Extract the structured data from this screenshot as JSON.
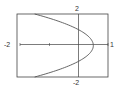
{
  "chart_data": {
    "type": "line",
    "title": "",
    "xlabel": "",
    "ylabel": "",
    "xlim": [
      -2,
      1
    ],
    "ylim": [
      -2,
      2
    ],
    "grid": false,
    "legend": null,
    "tick_labels": {
      "x_min": "-2",
      "x_max": "1",
      "y_max": "2",
      "y_min": "-2"
    },
    "x_ticks": [
      -1
    ],
    "series": [
      {
        "name": "x = 0.5(1 - y^2)",
        "points": [
          {
            "x": -1.5,
            "y": 2.0
          },
          {
            "x": -1.0,
            "y": 1.73
          },
          {
            "x": -0.5,
            "y": 1.41
          },
          {
            "x": 0.0,
            "y": 1.0
          },
          {
            "x": 0.3,
            "y": 0.63
          },
          {
            "x": 0.5,
            "y": 0.0
          },
          {
            "x": 0.3,
            "y": -0.63
          },
          {
            "x": 0.0,
            "y": -1.0
          },
          {
            "x": -0.5,
            "y": -1.41
          },
          {
            "x": -1.0,
            "y": -1.73
          },
          {
            "x": -1.5,
            "y": -2.0
          }
        ]
      }
    ]
  },
  "labels": {
    "top": "2",
    "bottom": "-2",
    "left": "-2",
    "right": "1"
  }
}
